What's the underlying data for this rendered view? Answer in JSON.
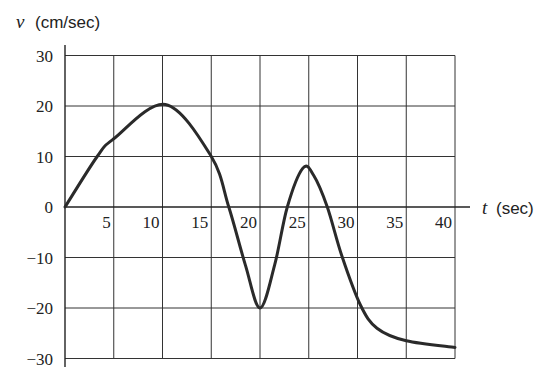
{
  "chart_data": {
    "type": "line",
    "title": "",
    "xlabel": "t (sec)",
    "xlabel_var": "t",
    "xlabel_unit": "(sec)",
    "ylabel": "v (cm/sec)",
    "ylabel_var": "v",
    "ylabel_unit": "(cm/sec)",
    "xlim": [
      0,
      40
    ],
    "ylim": [
      -30,
      30
    ],
    "grid": true,
    "legend": null,
    "x_ticks": [
      "5",
      "10",
      "15",
      "20",
      "25",
      "30",
      "35",
      "40"
    ],
    "y_ticks": [
      "30",
      "20",
      "10",
      "0",
      "−10",
      "−20",
      "−30"
    ],
    "series": [
      {
        "name": "v(t)",
        "color": "#2a2a2a",
        "x": [
          0,
          3.3,
          5,
          10.3,
          15,
          16.8,
          18.5,
          20,
          21.5,
          22.8,
          24.4,
          25.5,
          26.9,
          28.4,
          30.3,
          32,
          35,
          40
        ],
        "y": [
          0,
          10,
          13.5,
          20.3,
          10,
          0,
          -11.5,
          -20,
          -11.5,
          0,
          7.7,
          6.3,
          0,
          -9.7,
          -19.4,
          -24,
          -26.5,
          -27.8
        ]
      }
    ]
  }
}
